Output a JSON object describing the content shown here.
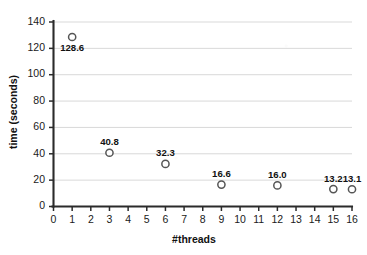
{
  "chart_data": {
    "type": "scatter",
    "title": "",
    "xlabel": "#threads",
    "ylabel": "time (seconds)",
    "xlim": [
      0,
      16
    ],
    "ylim": [
      0,
      140
    ],
    "ytick_step": 20,
    "xtick_step": 1,
    "grid": "horizontal",
    "legend": "none",
    "marker_style": "open-circle",
    "series": [
      {
        "name": "runtime",
        "points": [
          {
            "x": 1,
            "y": 128.6,
            "label": "128.6",
            "label_position": "below"
          },
          {
            "x": 3,
            "y": 40.8,
            "label": "40.8",
            "label_position": "above"
          },
          {
            "x": 6,
            "y": 32.3,
            "label": "32.3",
            "label_position": "above"
          },
          {
            "x": 9,
            "y": 16.6,
            "label": "16.6",
            "label_position": "above"
          },
          {
            "x": 12,
            "y": 16.0,
            "label": "16.0",
            "label_position": "above"
          },
          {
            "x": 15,
            "y": 13.2,
            "label": "13.2",
            "label_position": "above"
          },
          {
            "x": 16,
            "y": 13.1,
            "label": "13.1",
            "label_position": "above"
          }
        ]
      }
    ],
    "xticklabels": [
      "0",
      "1",
      "2",
      "3",
      "4",
      "5",
      "6",
      "7",
      "8",
      "9",
      "10",
      "11",
      "12",
      "13",
      "14",
      "15",
      "16"
    ],
    "yticklabels": [
      "0",
      "20",
      "40",
      "60",
      "80",
      "100",
      "120",
      "140"
    ],
    "colors": {
      "axis": "#2b2b2b",
      "grid": "#d9d9d9",
      "marker_stroke": "#555555",
      "marker_fill": "#ffffff",
      "text": "#111111",
      "background": "#ffffff"
    }
  }
}
